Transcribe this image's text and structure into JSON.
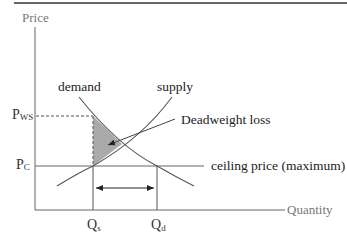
{
  "diagram": {
    "type": "supply-demand price ceiling",
    "axes": {
      "y_label": "Price",
      "x_label": "Quantity"
    },
    "curves": {
      "demand_label": "demand",
      "supply_label": "supply"
    },
    "annotations": {
      "deadweight_loss": "Deadweight loss",
      "ceiling_price": "ceiling price (maximum)"
    },
    "price_ticks": {
      "pws_main": "P",
      "pws_sub": "WS",
      "pc_main": "P",
      "pc_sub": "C"
    },
    "quantity_ticks": {
      "qs_main": "Q",
      "qs_sub": "s",
      "qd_main": "Q",
      "qd_sub": "d"
    },
    "colors": {
      "axis": "#666666",
      "curve": "#555555",
      "shaded_area": "#aaaaaa",
      "top_rule": "#333333"
    }
  }
}
